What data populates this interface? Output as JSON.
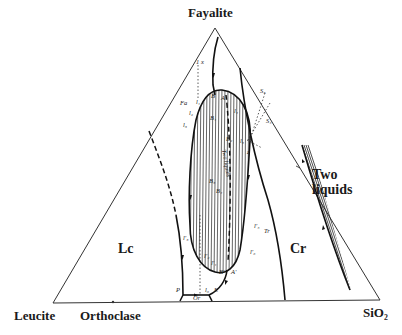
{
  "diagram": {
    "type": "ternary-phase-diagram",
    "vertices": {
      "top": "Fayalite",
      "bottom_left": "Leucite",
      "bottom_right": "SiO₂",
      "base_midpoint": "Orthoclase"
    },
    "fields": {
      "leucite": "Lc",
      "cristobalite": "Cr",
      "two_liquids_outer": [
        "Two",
        "liquids"
      ],
      "two_liquids_inner": "Two liquids",
      "orthoclase": "Or"
    },
    "points": {
      "A": "A",
      "B": "B",
      "A_prime": "A'",
      "B_prime": "B'",
      "P": "P",
      "E": "E",
      "Fa": "Fa",
      "Tr": "Tr",
      "X": "X",
      "S3": "S₃",
      "S4": "S₄",
      "B1": "B₁",
      "B2": "B₂",
      "B3": "B₃",
      "B4": "B₄",
      "l1": "l₁",
      "l2": "l₂",
      "l3": "l₃",
      "l4": "l₄",
      "l5": "l₅",
      "l6": "l₆",
      "l1p": "l′₁",
      "l2p": "l′₂",
      "l3p": "l′₃",
      "l5p": "l′₅",
      "l6p": "l′₆",
      "z": "z",
      "1x": "1 x"
    }
  }
}
